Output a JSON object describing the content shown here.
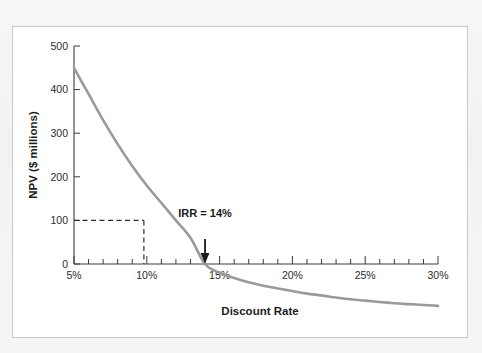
{
  "chart_data": {
    "type": "line",
    "title": "",
    "xlabel": "Discount Rate",
    "ylabel": "NPV ($ millions)",
    "xlim": [
      5,
      30
    ],
    "ylim": [
      -100,
      500
    ],
    "grid": false,
    "legend": "none",
    "x_tick_labels": [
      "5%",
      "10%",
      "15%",
      "20%",
      "25%",
      "30%"
    ],
    "x_tick_values": [
      5,
      10,
      15,
      20,
      25,
      30
    ],
    "x_minor_tick_step": 1,
    "y_tick_labels": [
      "0",
      "100",
      "200",
      "300",
      "400",
      "500"
    ],
    "y_tick_values": [
      0,
      100,
      200,
      300,
      400,
      500
    ],
    "series": [
      {
        "name": "NPV profile",
        "color": "#9a9a9a",
        "x": [
          5,
          6,
          7,
          8,
          9,
          10,
          11,
          12,
          13,
          14,
          15,
          16,
          17,
          18,
          19,
          20,
          21,
          22,
          23,
          24,
          25,
          26,
          27,
          28,
          29,
          30
        ],
        "y": [
          450,
          390,
          330,
          275,
          225,
          180,
          140,
          100,
          60,
          0,
          -20,
          -32,
          -42,
          -50,
          -56,
          -62,
          -68,
          -72,
          -77,
          -81,
          -84,
          -87,
          -90,
          -92,
          -94,
          -96
        ]
      }
    ],
    "annotations": [
      {
        "name": "irr-label",
        "text": "IRR = 14%",
        "x": 14,
        "y": 105,
        "arrow_to_x": 14,
        "arrow_to_y": 0
      },
      {
        "name": "npv-guide",
        "text": "",
        "type": "dashed-crosshair",
        "x": 9.8,
        "y": 100
      }
    ]
  }
}
